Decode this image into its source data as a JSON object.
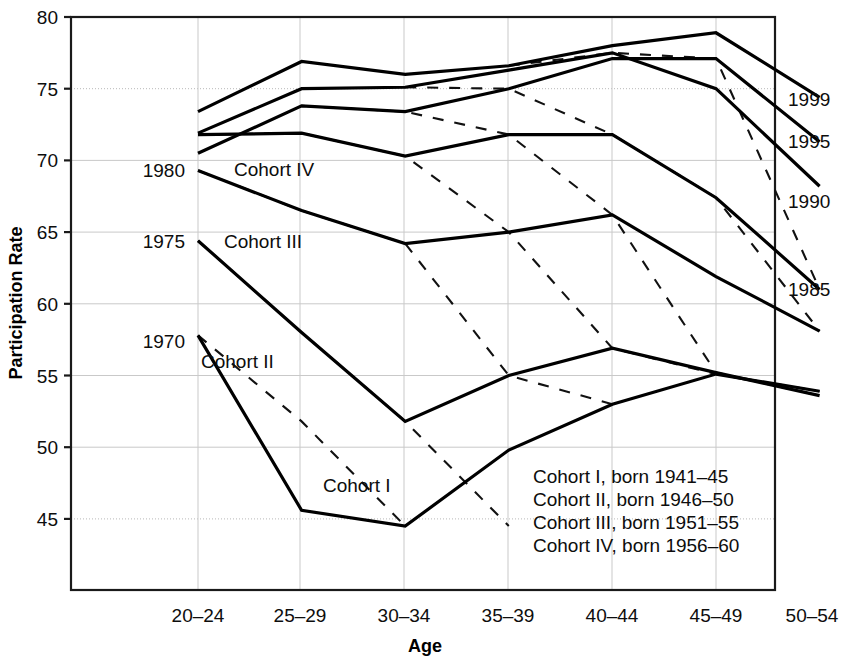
{
  "chart_data": {
    "type": "line",
    "title": "",
    "xlabel": "Age",
    "ylabel": "Participation Rate",
    "ylim": [
      41.5,
      80
    ],
    "xlim": [
      0,
      6
    ],
    "grid": true,
    "legend_position": "inside-bottom-right",
    "categories": [
      "20–24",
      "25–29",
      "30–34",
      "35–39",
      "40–44",
      "45–49",
      "50–54"
    ],
    "ytick_labels": [
      "80",
      "75",
      "70",
      "65",
      "60",
      "55",
      "50",
      "45"
    ],
    "ytick_values": [
      80,
      75,
      70,
      65,
      60,
      55,
      50,
      45
    ],
    "series": [
      {
        "name": "Cohort I",
        "style": "solid",
        "label": "Cohort I",
        "values": [
          57.8,
          45.6,
          44.5,
          49.8,
          53.0,
          55.1,
          53.9
        ]
      },
      {
        "name": "Cohort II",
        "style": "solid",
        "label": "Cohort II",
        "values": [
          64.4,
          58.0,
          51.8,
          55.0,
          56.9,
          55.2,
          53.6
        ]
      },
      {
        "name": "Cohort III",
        "style": "solid",
        "label": "Cohort III",
        "values": [
          69.3,
          66.5,
          64.2,
          65.0,
          66.2,
          61.9,
          58.1
        ]
      },
      {
        "name": "Cohort IV",
        "style": "solid",
        "label": "Cohort IV",
        "values": [
          71.8,
          71.9,
          70.3,
          71.8,
          71.8,
          67.4,
          61.0
        ]
      },
      {
        "name": "Cohort V",
        "style": "solid",
        "label": "",
        "values": [
          70.5,
          73.8,
          73.4,
          75.0,
          77.1,
          77.1,
          71.3
        ]
      },
      {
        "name": "Cohort VI",
        "style": "solid",
        "label": "",
        "values": [
          71.9,
          75.0,
          75.1,
          76.3,
          77.5,
          75.0,
          68.2
        ]
      },
      {
        "name": "Cohort VII",
        "style": "solid",
        "label": "",
        "values": [
          73.4,
          76.9,
          76.0,
          76.6,
          78.0,
          78.9,
          74.4
        ]
      }
    ],
    "period_lines": [
      {
        "name": "1970",
        "label_left": "1970",
        "label_right": "",
        "points": [
          [
            0,
            57.8
          ],
          [
            1,
            51.8
          ],
          [
            2,
            44.5
          ]
        ]
      },
      {
        "name": "1975",
        "label_left": "1975",
        "label_right": "",
        "points": [
          [
            0,
            64.4
          ],
          [
            1,
            58.0
          ],
          [
            2,
            51.8
          ],
          [
            3,
            44.5
          ]
        ]
      },
      {
        "name": "1980",
        "label_left": "1980",
        "label_right": "",
        "points": [
          [
            0,
            69.3
          ],
          [
            1,
            66.5
          ],
          [
            2,
            64.2
          ],
          [
            3,
            55.0
          ],
          [
            4,
            53.0
          ]
        ]
      },
      {
        "name": "1985",
        "label_left": "",
        "label_right": "1985",
        "points": [
          [
            0,
            71.8
          ],
          [
            1,
            71.9
          ],
          [
            2,
            70.3
          ],
          [
            3,
            65.0
          ],
          [
            4,
            56.9
          ],
          [
            5,
            55.1
          ],
          [
            6,
            53.9
          ]
        ]
      },
      {
        "name": "1990",
        "label_left": "",
        "label_right": "1990",
        "points": [
          [
            1,
            73.8
          ],
          [
            2,
            73.4
          ],
          [
            3,
            71.8
          ],
          [
            4,
            66.2
          ],
          [
            5,
            55.2
          ],
          [
            6,
            53.6
          ]
        ]
      },
      {
        "name": "1995",
        "label_left": "",
        "label_right": "1995",
        "points": [
          [
            2,
            75.1
          ],
          [
            3,
            75.0
          ],
          [
            4,
            71.8
          ],
          [
            5,
            67.4
          ],
          [
            6,
            58.1
          ]
        ]
      },
      {
        "name": "1999",
        "label_left": "",
        "label_right": "1999",
        "points": [
          [
            3,
            76.6
          ],
          [
            4,
            77.5
          ],
          [
            5,
            77.1
          ],
          [
            6,
            61.0
          ]
        ]
      }
    ],
    "legend_entries": [
      "Cohort I, born 1941–45",
      "Cohort II, born 1946–50",
      "Cohort III, born 1951–55",
      "Cohort IV, born 1956–60"
    ],
    "right_axis_labels": [
      "1999",
      "1995",
      "1990",
      "1985"
    ],
    "left_axis_labels": [
      "1980",
      "1975",
      "1970"
    ],
    "inline_cohort_labels": [
      "Cohort IV",
      "Cohort III",
      "Cohort II",
      "Cohort I"
    ],
    "colors": {
      "line": "#000000",
      "grid": "#c4c4c4",
      "text": "#0d0d0d",
      "background": "#ffffff"
    }
  }
}
